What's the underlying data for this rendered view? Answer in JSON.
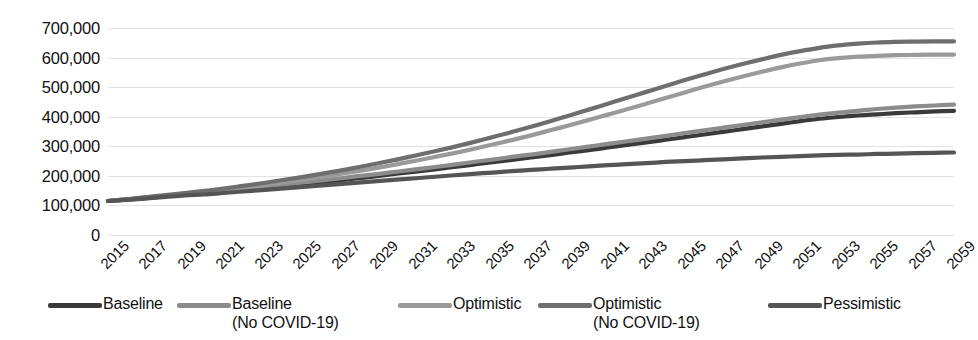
{
  "chart_data": {
    "type": "line",
    "title": "",
    "subtitle": "",
    "xlabel": "",
    "ylabel": "",
    "xlim": [
      2015,
      2059
    ],
    "ylim": [
      0,
      700000
    ],
    "grid": true,
    "legend_position": "bottom",
    "y_ticks": [
      "0",
      "100,000",
      "200,000",
      "300,000",
      "400,000",
      "500,000",
      "600,000",
      "700,000"
    ],
    "y_tick_values": [
      0,
      100000,
      200000,
      300000,
      400000,
      500000,
      600000,
      700000
    ],
    "x": [
      2015,
      2016,
      2017,
      2018,
      2019,
      2020,
      2021,
      2022,
      2023,
      2024,
      2025,
      2026,
      2027,
      2028,
      2029,
      2030,
      2031,
      2032,
      2033,
      2034,
      2035,
      2036,
      2037,
      2038,
      2039,
      2040,
      2041,
      2042,
      2043,
      2044,
      2045,
      2046,
      2047,
      2048,
      2049,
      2050,
      2051,
      2052,
      2053,
      2054,
      2055,
      2056,
      2057,
      2058,
      2059
    ],
    "x_tick_labels": [
      "2015",
      "2017",
      "2019",
      "2021",
      "2023",
      "2025",
      "2027",
      "2029",
      "2031",
      "2033",
      "2035",
      "2037",
      "2039",
      "2041",
      "2043",
      "2045",
      "2047",
      "2049",
      "2051",
      "2053",
      "2055",
      "2057",
      "2059"
    ],
    "series": [
      {
        "name": "Baseline",
        "color": "#3a3a3a",
        "values": [
          115000,
          120000,
          125000,
          131000,
          137000,
          140000,
          146000,
          152000,
          158000,
          164000,
          171000,
          178000,
          185000,
          192000,
          199000,
          207000,
          214000,
          222000,
          230000,
          238000,
          246000,
          254000,
          262000,
          270000,
          279000,
          287000,
          296000,
          305000,
          313000,
          322000,
          331000,
          340000,
          349000,
          358000,
          367000,
          376000,
          385000,
          393000,
          399000,
          404000,
          408000,
          412000,
          415000,
          418000,
          420000
        ]
      },
      {
        "name": "Baseline\n(No COVID-19)",
        "color": "#8c8c8c",
        "values": [
          115000,
          120000,
          126000,
          132000,
          138000,
          144000,
          150000,
          157000,
          163000,
          170000,
          177000,
          184000,
          191000,
          199000,
          206000,
          214000,
          222000,
          230000,
          238000,
          247000,
          255000,
          264000,
          272000,
          281000,
          290000,
          299000,
          308000,
          317000,
          326000,
          335000,
          345000,
          354000,
          363000,
          372000,
          381000,
          390000,
          399000,
          407000,
          414000,
          420000,
          426000,
          431000,
          435000,
          438000,
          441000
        ]
      },
      {
        "name": "Optimistic",
        "color": "#9a9a9a",
        "values": [
          115000,
          121000,
          127000,
          133000,
          140000,
          144000,
          152000,
          160000,
          168000,
          177000,
          186000,
          196000,
          206000,
          216000,
          227000,
          239000,
          251000,
          264000,
          277000,
          291000,
          306000,
          321000,
          337000,
          354000,
          371000,
          389000,
          407000,
          425000,
          444000,
          463000,
          482000,
          501000,
          519000,
          536000,
          552000,
          567000,
          580000,
          591000,
          598000,
          603000,
          606000,
          608000,
          609000,
          610000,
          610000
        ]
      },
      {
        "name": "Optimistic\n(No COVID-19)",
        "color": "#6e6e6e",
        "values": [
          115000,
          121000,
          128000,
          135000,
          142000,
          149000,
          157000,
          166000,
          175000,
          185000,
          195000,
          206000,
          217000,
          229000,
          242000,
          255000,
          269000,
          283000,
          298000,
          314000,
          331000,
          348000,
          366000,
          385000,
          404000,
          424000,
          444000,
          464000,
          484000,
          504000,
          524000,
          543000,
          561000,
          578000,
          594000,
          609000,
          622000,
          633000,
          641000,
          647000,
          651000,
          653000,
          654000,
          655000,
          655000
        ]
      },
      {
        "name": "Pessimistic",
        "color": "#555555",
        "values": [
          115000,
          119000,
          124000,
          129000,
          134000,
          137000,
          142000,
          147000,
          152000,
          157000,
          162000,
          167000,
          172000,
          177000,
          182000,
          187000,
          192000,
          197000,
          202000,
          207000,
          211000,
          216000,
          220000,
          224000,
          228000,
          232000,
          236000,
          240000,
          243000,
          247000,
          250000,
          253000,
          256000,
          259000,
          262000,
          264000,
          267000,
          269000,
          271000,
          272000,
          274000,
          275000,
          277000,
          278000,
          279000
        ]
      }
    ]
  },
  "legend": {
    "items": [
      {
        "label": "Baseline",
        "color": "#3a3a3a",
        "x": 48
      },
      {
        "label": "Baseline\n(No COVID-19)",
        "color": "#8c8c8c",
        "x": 177
      },
      {
        "label": "Optimistic",
        "color": "#9a9a9a",
        "x": 398
      },
      {
        "label": "Optimistic\n(No COVID-19)",
        "color": "#6e6e6e",
        "x": 538
      },
      {
        "label": "Pessimistic",
        "color": "#555555",
        "x": 768
      }
    ]
  }
}
